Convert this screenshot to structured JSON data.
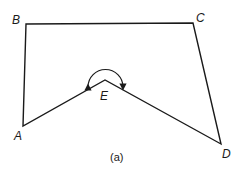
{
  "figure": {
    "caption": "(a)",
    "vertices": {
      "A": {
        "label": "A",
        "x": 23,
        "y": 126
      },
      "B": {
        "label": "B",
        "x": 26,
        "y": 24
      },
      "C": {
        "label": "C",
        "x": 193,
        "y": 23
      },
      "D": {
        "label": "D",
        "x": 221,
        "y": 144
      },
      "E": {
        "label": "E",
        "x": 105,
        "y": 80
      }
    },
    "edges": [
      "A-B",
      "B-C",
      "C-D",
      "D-E",
      "E-A"
    ],
    "reflex_angle_marker": {
      "vertex": "E",
      "arrows": "both-ends"
    },
    "stroke_color": "#1a1a1a"
  }
}
